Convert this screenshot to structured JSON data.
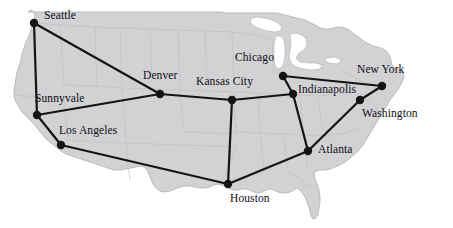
{
  "figure": {
    "type": "network-topology-map",
    "region": "United States",
    "background_color": "#ffffff",
    "land_color": "#d2d2d4",
    "state_border_color": "#c0c0c4",
    "coast_outline_color": "#b5b5ba",
    "water_color": "#ffffff",
    "link_color": "#141414",
    "node_color": "#141414",
    "label_color": "#0d0d14",
    "link_width": 2.2,
    "node_radius": 4.2,
    "width": 453,
    "height": 228
  },
  "chart_data": {
    "type": "network-graph",
    "title": "",
    "nodes": [
      {
        "id": "seattle",
        "label": "Seattle",
        "x": 34,
        "y": 23,
        "label_x": 44,
        "label_y": 10,
        "label_anchor": "right-above"
      },
      {
        "id": "sunnyvale",
        "label": "Sunnyvale",
        "x": 37,
        "y": 115,
        "label_x": 35,
        "label_y": 93,
        "label_anchor": "above"
      },
      {
        "id": "los-angeles",
        "label": "Los Angeles",
        "x": 61,
        "y": 145,
        "label_x": 59,
        "label_y": 125,
        "label_anchor": "right-above"
      },
      {
        "id": "denver",
        "label": "Denver",
        "x": 160,
        "y": 94,
        "label_x": 143,
        "label_y": 70,
        "label_anchor": "above"
      },
      {
        "id": "kansas-city",
        "label": "Kansas City",
        "x": 232,
        "y": 100,
        "label_x": 196,
        "label_y": 76,
        "label_anchor": "above"
      },
      {
        "id": "houston",
        "label": "Houston",
        "x": 228,
        "y": 184,
        "label_x": 230,
        "label_y": 193,
        "label_anchor": "below"
      },
      {
        "id": "chicago",
        "label": "Chicago",
        "x": 283,
        "y": 76,
        "label_x": 235,
        "label_y": 52,
        "label_anchor": "left-above"
      },
      {
        "id": "indianapolis",
        "label": "Indianapolis",
        "x": 293,
        "y": 94,
        "label_x": 298,
        "label_y": 84,
        "label_anchor": "right"
      },
      {
        "id": "atlanta",
        "label": "Atlanta",
        "x": 308,
        "y": 151,
        "label_x": 318,
        "label_y": 144,
        "label_anchor": "right"
      },
      {
        "id": "washington",
        "label": "Washington",
        "x": 360,
        "y": 100,
        "label_x": 362,
        "label_y": 108,
        "label_anchor": "right-below"
      },
      {
        "id": "new-york",
        "label": "New York",
        "x": 382,
        "y": 86,
        "label_x": 357,
        "label_y": 64,
        "label_anchor": "above"
      }
    ],
    "edges": [
      {
        "from": "seattle",
        "to": "sunnyvale"
      },
      {
        "from": "seattle",
        "to": "denver"
      },
      {
        "from": "sunnyvale",
        "to": "denver"
      },
      {
        "from": "sunnyvale",
        "to": "los-angeles"
      },
      {
        "from": "los-angeles",
        "to": "houston"
      },
      {
        "from": "denver",
        "to": "kansas-city"
      },
      {
        "from": "kansas-city",
        "to": "houston"
      },
      {
        "from": "kansas-city",
        "to": "indianapolis"
      },
      {
        "from": "chicago",
        "to": "indianapolis"
      },
      {
        "from": "chicago",
        "to": "new-york"
      },
      {
        "from": "indianapolis",
        "to": "atlanta"
      },
      {
        "from": "atlanta",
        "to": "houston"
      },
      {
        "from": "atlanta",
        "to": "washington"
      },
      {
        "from": "washington",
        "to": "new-york"
      }
    ],
    "node_count": 11,
    "edge_count": 14
  },
  "geometry": {
    "land_path": "M 28,12 L 31,10 L 34,12 L 35,18 L 33,24 L 31,30 L 29,36 L 26,42 L 24,48 L 22,54 L 21,60 L 19,66 L 17,72 L 16,78 L 15,84 L 14,90 L 14,96 L 16,102 L 19,107 L 22,112 L 26,116 L 30,120 L 34,124 L 38,129 L 42,134 L 46,139 L 51,143 L 56,147 L 61,151 L 66,154 L 72,156 L 78,158 L 84,160 L 90,162 L 96,164 L 102,166 L 108,168 L 114,170 L 120,170 L 126,169 L 131,168 L 136,167 L 140,166 L 144,167 L 147,170 L 149,174 L 151,179 L 153,184 L 156,188 L 160,191 L 165,192 L 170,191 L 175,189 L 180,187 L 185,186 L 190,186 L 195,187 L 200,188 L 205,188 L 210,187 L 214,185 L 218,184 L 222,185 L 226,187 L 230,189 L 234,190 L 238,190 L 242,189 L 246,189 L 250,190 L 254,192 L 258,193 L 262,192 L 266,190 L 270,189 L 274,190 L 278,192 L 282,193 L 286,193 L 290,192 L 294,190 L 297,188 L 300,190 L 303,194 L 306,199 L 308,205 L 310,211 L 311,216 L 313,219 L 316,218 L 318,214 L 319,208 L 320,202 L 320,196 L 319,190 L 317,184 L 315,179 L 314,174 L 316,171 L 320,170 L 325,170 L 330,169 L 335,167 L 340,165 L 345,162 L 350,158 L 355,154 L 359,150 L 363,145 L 366,140 L 369,135 L 372,130 L 375,125 L 378,120 L 381,115 L 384,110 L 387,105 L 390,100 L 393,96 L 396,92 L 399,88 L 401,84 L 403,80 L 404,76 L 403,72 L 400,70 L 397,69 L 394,68 L 392,65 L 391,61 L 390,57 L 388,53 L 385,50 L 381,48 L 377,47 L 373,46 L 369,44 L 365,42 L 361,39 L 357,36 L 353,33 L 349,30 L 345,28 L 341,27 L 337,27 L 333,28 L 329,29 L 325,29 L 321,28 L 317,26 L 313,24 L 309,22 L 305,20 L 301,19 L 297,18 L 293,17 L 289,16 L 285,15 L 281,14 L 277,13 L 273,13 L 269,13 L 265,13 L 261,13 L 257,13 L 253,13 L 249,13 L 245,13 L 241,13 L 237,13 L 233,13 L 229,13 L 225,13 L 221,12 L 217,12 L 213,12 L 209,12 L 205,12 L 201,12 L 197,12 L 193,12 L 189,12 L 185,12 L 181,12 L 177,12 L 173,12 L 169,12 L 165,12 L 161,12 L 157,12 L 153,12 L 149,12 L 145,12 L 141,12 L 137,12 L 133,12 L 129,12 L 125,12 L 121,12 L 117,12 L 113,12 L 109,12 L 105,12 L 101,12 L 97,12 L 93,12 L 89,12 L 85,12 L 81,12 L 77,12 L 73,12 L 69,12 L 65,12 L 61,12 L 57,12 L 53,12 L 49,12 L 45,12 L 41,12 L 37,12 Z",
    "lake_superior_path": "M 252,18 L 258,17 L 265,18 L 272,20 L 278,23 L 282,27 L 280,31 L 274,32 L 267,31 L 260,29 L 254,26 L 250,22 Z",
    "lake_michigan_path": "M 276,36 L 281,36 L 284,40 L 285,47 L 285,55 L 284,62 L 282,67 L 278,69 L 275,66 L 274,59 L 274,51 L 274,43 Z",
    "lake_huron_erie_path": "M 290,34 L 296,33 L 302,35 L 306,39 L 307,45 L 304,50 L 299,53 L 296,58 L 300,62 L 308,63 L 316,63 L 322,65 L 320,69 L 312,70 L 303,69 L 296,67 L 291,63 L 289,57 L 290,50 L 291,43 Z",
    "lake_ontario_path": "M 326,58 L 334,57 L 340,59 L 341,62 L 336,64 L 329,63 L 325,61 Z",
    "state_lines": [
      "M 34,23 L 60,25 L 95,27 L 120,28",
      "M 120,28 L 121,60 L 122,88",
      "M 60,25 L 62,55 L 64,85",
      "M 14,95 L 40,97 L 64,99",
      "M 64,85 L 95,86 L 122,88",
      "M 64,99 L 66,120 L 68,140",
      "M 95,27 L 96,60 L 97,86",
      "M 122,88 L 124,115 L 126,140",
      "M 68,140 L 100,142 L 126,143",
      "M 126,140 L 128,165 L 130,180",
      "M 120,28 L 150,29 L 178,30",
      "M 150,29 L 151,58 L 152,82",
      "M 122,88 L 152,89 L 180,90",
      "M 178,30 L 179,58 L 180,90",
      "M 180,90 L 182,112 L 184,132",
      "M 126,143 L 155,144 L 184,145",
      "M 178,30 L 205,31 L 232,32",
      "M 205,31 L 206,58 L 207,80",
      "M 180,90 L 207,91 L 234,92",
      "M 232,32 L 233,58 L 234,80",
      "M 234,92 L 235,112 L 236,132",
      "M 184,145 L 210,146 L 236,147",
      "M 184,132 L 212,133 L 238,134",
      "M 236,147 L 228,170 L 220,184",
      "M 232,32 L 255,35 L 272,40",
      "M 234,92 L 258,93 L 280,94",
      "M 258,93 L 259,112 L 260,130",
      "M 236,132 L 260,133 L 284,134",
      "M 260,130 L 262,152 L 264,170",
      "M 284,134 L 286,155 L 288,172",
      "M 272,40 L 273,60 L 274,74",
      "M 280,94 L 300,95 L 318,96",
      "M 300,95 L 302,115 L 304,133",
      "M 284,134 L 306,135 L 326,136",
      "M 304,133 L 306,152 L 308,170",
      "M 318,96 L 320,112 L 322,128",
      "M 326,136 L 345,133 L 358,128",
      "M 322,128 L 338,143 L 350,152",
      "M 318,96 L 338,94 L 356,92",
      "M 356,92 L 368,101 L 378,110",
      "M 340,70 L 356,78 L 370,86",
      "M 356,92 L 362,104 L 368,115",
      "M 288,172 L 302,180 L 312,188"
    ]
  }
}
